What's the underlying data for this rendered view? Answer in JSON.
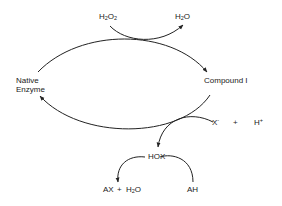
{
  "diagram": {
    "type": "reaction-cycle",
    "nodes": {
      "native_enzyme": {
        "line1": "Native",
        "line2": "Enzyme"
      },
      "compound_i": "Compound I",
      "h2o2": {
        "main": "H",
        "sub1": "2",
        "mid": "O",
        "sub2": "2"
      },
      "h2o_top": {
        "main": "H",
        "sub": "2",
        "end": "O"
      },
      "x_minus": {
        "main": "X",
        "sup": "-"
      },
      "plus1": "+",
      "h_plus": {
        "main": "H",
        "sup": "+"
      },
      "hox": "HOX",
      "ax": "AX",
      "plus2": "+",
      "h2o_bottom": {
        "main": "H",
        "sub": "2",
        "end": "O"
      },
      "ah": "AH"
    },
    "edges": [
      {
        "from": "Native Enzyme",
        "to": "Compound I",
        "via": "H2O2 -> H2O"
      },
      {
        "from": "Compound I",
        "to": "Native Enzyme",
        "via": "X- + H+ -> HOX"
      },
      {
        "from": "HOX",
        "to": "AX + H2O",
        "via": "AH"
      }
    ],
    "colors": {
      "line": "#222222",
      "background": "#ffffff"
    }
  }
}
